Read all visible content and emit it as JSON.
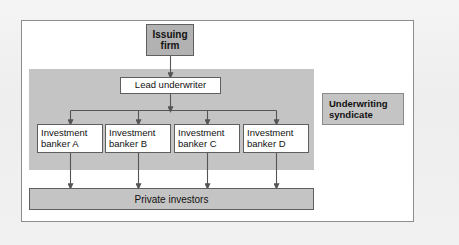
{
  "diagram": {
    "nodes": {
      "issuing_firm": {
        "label": "Issuing\nfirm",
        "fill": "#b2b2b2",
        "border": "#5f5f5f"
      },
      "lead_underwriter": {
        "label": "Lead underwriter",
        "fill": "#ffffff",
        "border": "#5f5f5f"
      },
      "private_investors": {
        "label": "Private investors",
        "fill": "#c4c4c4",
        "border": "#5f5f5f"
      },
      "underwriting_syndicate": {
        "label": "Underwriting\nsyndicate",
        "fill": "#c4c4c4",
        "border": "#8b8b8b"
      }
    },
    "bankers": [
      {
        "id": "a",
        "label": "Investment\nbanker A"
      },
      {
        "id": "b",
        "label": "Investment\nbanker B"
      },
      {
        "id": "c",
        "label": "Investment\nbanker C"
      },
      {
        "id": "d",
        "label": "Investment\nbanker D"
      }
    ],
    "regions": {
      "syndicate_region": {
        "fill": "#c4c4c4"
      },
      "outer_frame": {
        "fill": "#ffffff",
        "border": "#8d8d8d"
      }
    },
    "colors": {
      "page_background": "#f1f1f1",
      "connector": "#555555",
      "text": "#111111"
    }
  }
}
